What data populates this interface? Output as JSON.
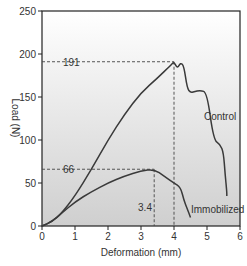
{
  "chart_data": {
    "type": "line",
    "title": "",
    "xlabel": "Deformation (mm)",
    "ylabel": "Load (N)",
    "xlim": [
      0,
      6
    ],
    "ylim": [
      0,
      250
    ],
    "xticks": [
      "0",
      "1",
      "2",
      "3",
      "4",
      "5",
      "6"
    ],
    "yticks": [
      "0",
      "50",
      "100",
      "150",
      "200",
      "250"
    ],
    "grid": false,
    "legend": "inline labels",
    "series": [
      {
        "name": "Control",
        "x": [
          0,
          0.3,
          0.6,
          1.0,
          1.5,
          2.0,
          2.5,
          3.0,
          3.5,
          3.9,
          4.0,
          4.1,
          4.2,
          4.3,
          4.4,
          4.5,
          4.6,
          4.8,
          5.0,
          5.2,
          5.4,
          5.5,
          5.55,
          5.6,
          5.6
        ],
        "values": [
          0,
          5,
          15,
          35,
          66,
          100,
          130,
          155,
          172,
          187,
          191,
          183,
          190,
          186,
          160,
          155,
          156,
          158,
          155,
          100,
          95,
          85,
          60,
          40,
          35
        ]
      },
      {
        "name": "Immobilized",
        "x": [
          0,
          0.3,
          0.6,
          1.0,
          1.5,
          2.0,
          2.5,
          3.0,
          3.4,
          3.7,
          4.0,
          4.2,
          4.3,
          4.4,
          4.5
        ],
        "values": [
          0,
          5,
          15,
          28,
          40,
          50,
          58,
          64,
          66,
          58,
          50,
          45,
          30,
          20,
          10
        ]
      }
    ],
    "annotations": [
      {
        "text": "191",
        "type": "hline",
        "y": 191,
        "x_end": 4.0
      },
      {
        "text": "66",
        "type": "hline",
        "y": 66,
        "x_end": 3.4
      },
      {
        "text": "3.4",
        "type": "vline",
        "x": 3.4,
        "y_end": 66
      },
      {
        "text": "",
        "type": "vline",
        "x": 4.0,
        "y_end": 191
      }
    ]
  },
  "labels": {
    "control": "Control",
    "immobilized": "Immobilized",
    "peak_control": "191",
    "peak_immobilized": "66",
    "deform_immobilized": "3.4",
    "xlabel": "Deformation (mm)",
    "ylabel": "Load (N)"
  }
}
